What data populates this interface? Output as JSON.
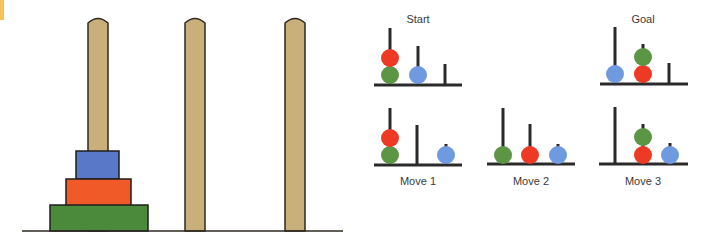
{
  "colors": {
    "peg_fill": "#c9b07a",
    "peg_stroke": "#2e2a22",
    "base_line": "#2e2a22",
    "disk_blue": "#5a78c8",
    "disk_orange": "#f05a28",
    "disk_green": "#4a8a3a",
    "ball_red": "#ee3a24",
    "ball_green": "#5c9645",
    "ball_blue": "#6f9ae0",
    "accent": "#f4c15a"
  },
  "large_tower": {
    "pegs": [
      {
        "name": "peg-1",
        "x": 88,
        "width": 20,
        "top": 17
      },
      {
        "name": "peg-2",
        "x": 185,
        "width": 20,
        "top": 17
      },
      {
        "name": "peg-3",
        "x": 285,
        "width": 20,
        "top": 17
      }
    ],
    "base": {
      "x1": 22,
      "x2": 343,
      "y": 231
    },
    "disks": [
      {
        "name": "small-blue-disk",
        "color": "disk_blue",
        "x": 76,
        "y": 151,
        "w": 43,
        "h": 28
      },
      {
        "name": "medium-orange-disk",
        "color": "disk_orange",
        "x": 66,
        "y": 179,
        "w": 65,
        "h": 27
      },
      {
        "name": "large-green-disk",
        "color": "disk_green",
        "x": 50,
        "y": 205,
        "w": 98,
        "h": 26
      }
    ]
  },
  "mini_diagrams": [
    {
      "name": "start",
      "label": "Start",
      "label_pos": {
        "x": 418,
        "y": 13
      },
      "base": {
        "x1": 374,
        "x2": 462,
        "y": 85
      },
      "poles": [
        {
          "x": 390,
          "top": 28
        },
        {
          "x": 418,
          "top": 46
        },
        {
          "x": 445,
          "top": 64
        }
      ],
      "balls": [
        {
          "color": "ball_green",
          "cx": 390,
          "cy": 75
        },
        {
          "color": "ball_red",
          "cx": 390,
          "cy": 58
        },
        {
          "color": "ball_blue",
          "cx": 418,
          "cy": 75
        }
      ]
    },
    {
      "name": "goal",
      "label": "Goal",
      "label_pos": {
        "x": 643,
        "y": 13
      },
      "base": {
        "x1": 600,
        "x2": 688,
        "y": 84
      },
      "poles": [
        {
          "x": 615,
          "top": 27
        },
        {
          "x": 643,
          "top": 44
        },
        {
          "x": 669,
          "top": 63
        }
      ],
      "balls": [
        {
          "color": "ball_blue",
          "cx": 615,
          "cy": 74
        },
        {
          "color": "ball_red",
          "cx": 643,
          "cy": 74
        },
        {
          "color": "ball_green",
          "cx": 643,
          "cy": 57
        }
      ]
    },
    {
      "name": "move-1",
      "label": "Move 1",
      "label_pos": {
        "x": 418,
        "y": 175
      },
      "base": {
        "x1": 374,
        "x2": 462,
        "y": 165
      },
      "poles": [
        {
          "x": 390,
          "top": 108
        },
        {
          "x": 417,
          "top": 125
        },
        {
          "x": 446,
          "top": 144
        }
      ],
      "balls": [
        {
          "color": "ball_green",
          "cx": 390,
          "cy": 155
        },
        {
          "color": "ball_red",
          "cx": 390,
          "cy": 138
        },
        {
          "color": "ball_blue",
          "cx": 446,
          "cy": 155
        }
      ]
    },
    {
      "name": "move-2",
      "label": "Move 2",
      "label_pos": {
        "x": 531,
        "y": 175
      },
      "base": {
        "x1": 487,
        "x2": 575,
        "y": 164
      },
      "poles": [
        {
          "x": 503,
          "top": 108
        },
        {
          "x": 530,
          "top": 124
        },
        {
          "x": 558,
          "top": 144
        }
      ],
      "balls": [
        {
          "color": "ball_green",
          "cx": 503,
          "cy": 155
        },
        {
          "color": "ball_red",
          "cx": 530,
          "cy": 155
        },
        {
          "color": "ball_blue",
          "cx": 558,
          "cy": 155
        }
      ]
    },
    {
      "name": "move-3",
      "label": "Move 3",
      "label_pos": {
        "x": 643,
        "y": 175
      },
      "base": {
        "x1": 599,
        "x2": 688,
        "y": 164
      },
      "poles": [
        {
          "x": 615,
          "top": 107
        },
        {
          "x": 643,
          "top": 124
        },
        {
          "x": 670,
          "top": 143
        }
      ],
      "balls": [
        {
          "color": "ball_red",
          "cx": 643,
          "cy": 155
        },
        {
          "color": "ball_green",
          "cx": 643,
          "cy": 137
        },
        {
          "color": "ball_blue",
          "cx": 670,
          "cy": 155
        }
      ]
    }
  ]
}
